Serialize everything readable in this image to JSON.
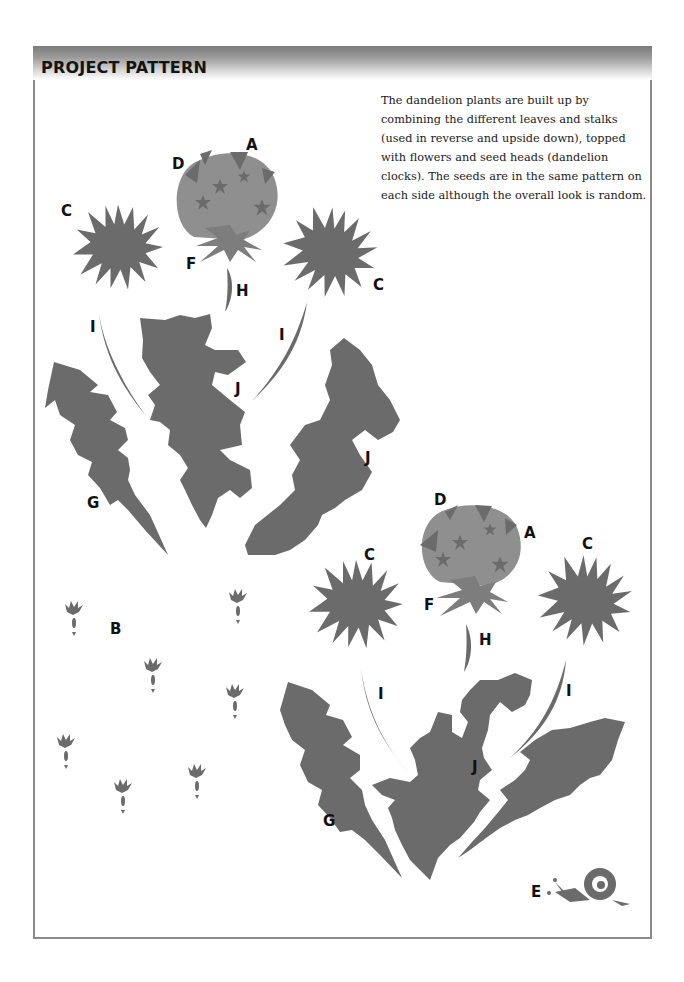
{
  "header": {
    "title": "PROJECT PATTERN"
  },
  "description": "The dandelion plants are built up by combining the different leaves and stalks (used in reverse and upside down), topped with flowers and seed heads (dandelion clocks). The seeds are in the same pattern on each side although the overall look is random.",
  "colors": {
    "header_dark": "#7a7a7a",
    "shape_fill": "#6b6b6b",
    "seedhead_fill": "#8f8f8f",
    "frame_border": "#8a8a8a"
  },
  "labels": {
    "plant1": {
      "A": "A",
      "D": "D",
      "C_left": "C",
      "F": "F",
      "C_right": "C",
      "H": "H",
      "I_left": "I",
      "I_right": "I",
      "J_center": "J",
      "J_right": "J",
      "G": "G"
    },
    "seeds": {
      "B": "B"
    },
    "plant2": {
      "D": "D",
      "A": "A",
      "C_left": "C",
      "C_right": "C",
      "F": "F",
      "H": "H",
      "I_left": "I",
      "I_right": "I",
      "J": "J",
      "G": "G",
      "E": "E"
    }
  },
  "pieces": [
    {
      "letter": "A",
      "name": "seed-head"
    },
    {
      "letter": "B",
      "name": "seed"
    },
    {
      "letter": "C",
      "name": "flower"
    },
    {
      "letter": "D",
      "name": "seed-head-star"
    },
    {
      "letter": "E",
      "name": "snail"
    },
    {
      "letter": "F",
      "name": "sepals"
    },
    {
      "letter": "G",
      "name": "leaf"
    },
    {
      "letter": "H",
      "name": "short-stalk"
    },
    {
      "letter": "I",
      "name": "long-stalk"
    },
    {
      "letter": "J",
      "name": "leaf"
    }
  ]
}
